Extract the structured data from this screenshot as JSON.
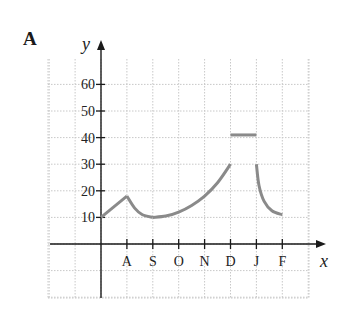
{
  "panel_label": "A",
  "chart_data": {
    "type": "line",
    "title": "",
    "panel": "A",
    "xlabel": "x",
    "ylabel": "y",
    "x_ticks": [
      "A",
      "S",
      "O",
      "N",
      "D",
      "J",
      "F"
    ],
    "y_ticks": [
      10,
      20,
      30,
      40,
      50,
      60
    ],
    "ylim": [
      -7,
      70
    ],
    "grid": true,
    "segments": [
      {
        "name": "rise",
        "points": [
          [
            0,
            10
          ],
          [
            1,
            18
          ]
        ]
      },
      {
        "name": "decay-to-S",
        "points": [
          [
            1,
            18
          ],
          [
            1.3,
            13.5
          ],
          [
            1.6,
            11
          ],
          [
            2,
            10
          ]
        ]
      },
      {
        "name": "growth-to-D",
        "points": [
          [
            2,
            10
          ],
          [
            2.5,
            10.5
          ],
          [
            3,
            12
          ],
          [
            3.5,
            14.5
          ],
          [
            4,
            18
          ],
          [
            4.5,
            23
          ],
          [
            5,
            30
          ]
        ]
      },
      {
        "name": "flat-D-to-J",
        "points": [
          [
            5,
            41
          ],
          [
            6,
            41
          ]
        ]
      },
      {
        "name": "decay-to-F",
        "points": [
          [
            6,
            30
          ],
          [
            6.1,
            22
          ],
          [
            6.3,
            16
          ],
          [
            6.6,
            12.5
          ],
          [
            7,
            11
          ]
        ]
      }
    ]
  }
}
